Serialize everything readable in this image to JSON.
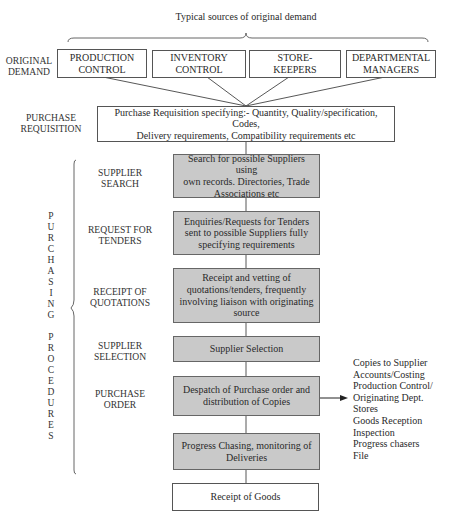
{
  "header": {
    "sources_caption": "Typical sources of original demand"
  },
  "stage_labels": {
    "original_demand": [
      "ORIGINAL",
      "DEMAND"
    ],
    "purchase_requisition": [
      "PURCHASE",
      "REQUISITION"
    ],
    "supplier_search": [
      "SUPPLIER",
      "SEARCH"
    ],
    "request_for_tenders": [
      "REQUEST FOR",
      "TENDERS"
    ],
    "receipt_of_quotations": [
      "RECEIPT OF",
      "QUOTATIONS"
    ],
    "supplier_selection": [
      "SUPPLIER",
      "SELECTION"
    ],
    "purchase_order": [
      "PURCHASE",
      "ORDER"
    ]
  },
  "demand_sources": [
    {
      "line1": "PRODUCTION",
      "line2": "CONTROL"
    },
    {
      "line1": "INVENTORY",
      "line2": "CONTROL"
    },
    {
      "line1": "STORE-",
      "line2": "KEEPERS"
    },
    {
      "line1": "DEPARTMENTAL",
      "line2": "MANAGERS"
    }
  ],
  "requisition_box": {
    "line1": "Purchase Requisition specifying:- Quantity, Quality/specification, Codes,",
    "line2": "Delivery requirements, Compatibility requirements etc"
  },
  "process_boxes": [
    {
      "lines": [
        "Search for possible Suppliers using",
        "own records. Directories, Trade",
        "Associations etc"
      ],
      "fill": "gray"
    },
    {
      "lines": [
        "Enquiries/Requests for Tenders",
        "sent to possible Suppliers fully",
        "specifying requirements"
      ],
      "fill": "gray"
    },
    {
      "lines": [
        "Receipt and vetting of",
        "quotations/tenders, frequently",
        "involving liaison with originating",
        "source"
      ],
      "fill": "gray"
    },
    {
      "lines": [
        "Supplier Selection"
      ],
      "fill": "gray"
    },
    {
      "lines": [
        "Despatch of Purchase order and",
        "distribution of Copies"
      ],
      "fill": "gray"
    },
    {
      "lines": [
        "Progress Chasing, monitoring of",
        "Deliveries"
      ],
      "fill": "gray"
    },
    {
      "lines": [
        "Receipt of Goods"
      ],
      "fill": "white"
    }
  ],
  "side_brace_text": [
    "P",
    "U",
    "R",
    "C",
    "H",
    "A",
    "S",
    "I",
    "N",
    "G",
    "",
    "P",
    "R",
    "O",
    "C",
    "E",
    "D",
    "U",
    "R",
    "E",
    "S"
  ],
  "copies_list": [
    "Copies to Supplier",
    "Accounts/Costing",
    "Production Control/",
    "Originating Dept.",
    "Stores",
    "Goods Reception",
    "Inspection",
    "Progress chasers",
    "File"
  ],
  "colors": {
    "gray_fill": "#c9c9c9",
    "border": "#555555",
    "text": "#2a2a2a"
  }
}
